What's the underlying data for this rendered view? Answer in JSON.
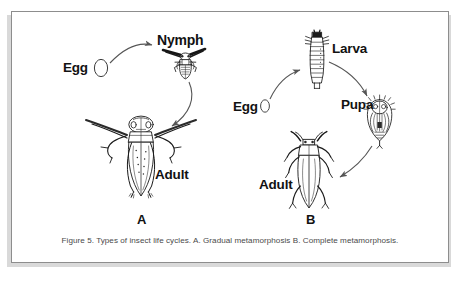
{
  "figure": {
    "caption": "Figure 5. Types of insect life cycles. A. Gradual metamorphosis B. Complete metamorphosis.",
    "ink_color": "#1a1a1a",
    "line_color": "#555555",
    "frame_color": "#8d8d8d",
    "background_color": "#ffffff",
    "caption_color": "#4a4a4a"
  },
  "panels": [
    {
      "letter": "A",
      "title": "Gradual metamorphosis",
      "stages": [
        {
          "name": "Egg",
          "label": "Egg"
        },
        {
          "name": "Nymph",
          "label": "Nymph"
        },
        {
          "name": "Adult",
          "label": "Adult"
        }
      ]
    },
    {
      "letter": "B",
      "title": "Complete metamorphosis",
      "stages": [
        {
          "name": "Egg",
          "label": "Egg"
        },
        {
          "name": "Larva",
          "label": "Larva"
        },
        {
          "name": "Pupa",
          "label": "Pupa"
        },
        {
          "name": "Adult",
          "label": "Adult"
        }
      ]
    }
  ],
  "labels": {
    "egg_a": "Egg",
    "nymph": "Nymph",
    "adult_a": "Adult",
    "letter_a": "A",
    "egg_b": "Egg",
    "larva": "Larva",
    "pupa": "Pupa",
    "adult_b": "Adult",
    "letter_b": "B"
  }
}
